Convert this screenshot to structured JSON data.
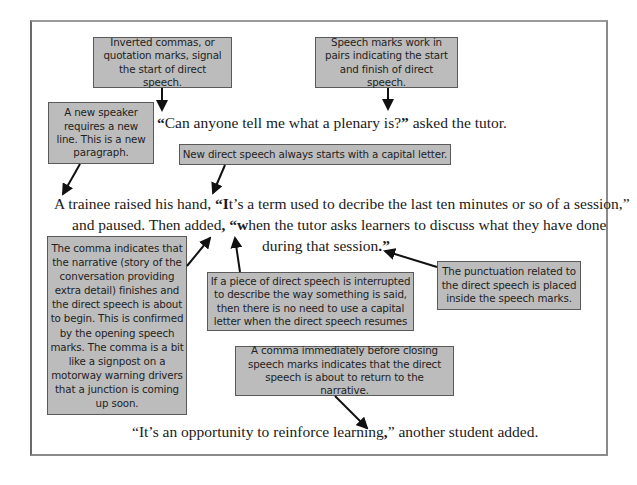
{
  "callouts": {
    "inverted_commas": "Inverted commas, or quotation marks, signal the start of direct speech.",
    "pairs": "Speech marks work in pairs indicating the start and finish of direct speech.",
    "new_speaker": "A new speaker requires a new line. This is a new paragraph.",
    "capital_letter": "New direct speech always starts with a capital letter.",
    "comma_narrative": "The comma indicates that the narrative (story of the conversation providing extra detail) finishes and the direct speech is about to begin. This is confirmed by the opening speech marks. The comma is a bit like a signpost on a motorway warning drivers that a junction is coming up soon.",
    "interrupted": "If a piece of direct speech is interrupted to describe the way something is said, then there is no need to use a capital letter when the direct speech resumes",
    "punctuation_inside": "The punctuation related to the direct speech is placed inside the speech marks.",
    "comma_before_closing": "A comma immediately before closing speech marks indicates that the direct speech is about to return to the narrative."
  },
  "dialogue": {
    "line1": {
      "open_quote": "“",
      "speech": "Can anyone tell me what a plenary is?",
      "close_quote": "”",
      "narrative": " asked the tutor."
    },
    "line2": {
      "narrative_start": "A trainee raised his hand, ",
      "open_quote": "“",
      "capital": "I",
      "speech_a": "t’s a term used to decribe the last ten minutes or so of a session,”",
      "line2b_start": "and paused. Then added",
      "comma": ",",
      "space": " ",
      "open_quote2": "“",
      "lower": "w",
      "speech_b": "hen the tutor asks learners to discuss what they have done",
      "line2c": "during that session",
      "period": ".",
      "close_quote2": "”"
    },
    "line3": {
      "open_quote": "“",
      "speech": "It’s an opportunity to reinforce learning",
      "comma": ",",
      "close_quote": "”",
      "narrative": " another student added."
    }
  },
  "colors": {
    "callout_fill": "#bcbcbc",
    "callout_border": "#5a5a5a",
    "arrow": "#111111"
  }
}
